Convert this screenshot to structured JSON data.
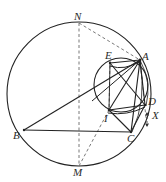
{
  "figure": {
    "stroke_color": "#222222",
    "dashed_color": "#666666",
    "background": "#ffffff",
    "width": 166,
    "height": 182
  },
  "circles": {
    "circumcircle": {
      "name": "large-circle",
      "cx": 79,
      "cy": 94,
      "r": 72
    },
    "inner_circle": {
      "name": "small-circle",
      "cx": 121,
      "cy": 85,
      "r": 27
    }
  },
  "points": {
    "A": {
      "label": "A",
      "x": 140,
      "y": 60,
      "label_x": 142,
      "label_y": 52
    },
    "B": {
      "label": "B",
      "x": 24,
      "y": 130,
      "label_x": 14,
      "label_y": 131
    },
    "C": {
      "label": "C",
      "x": 131,
      "y": 132,
      "label_x": 128,
      "label_y": 134
    },
    "D": {
      "label": "D",
      "x": 145,
      "y": 105,
      "label_x": 148,
      "label_y": 98
    },
    "E": {
      "label": "E",
      "x": 110,
      "y": 63,
      "label_x": 106,
      "label_y": 51
    },
    "I": {
      "label": "I",
      "x": 109,
      "y": 110,
      "label_x": 106,
      "label_y": 113
    },
    "M": {
      "label": "M",
      "x": 79,
      "y": 166,
      "label_x": 74,
      "label_y": 168
    },
    "N": {
      "label": "N",
      "x": 79,
      "y": 23,
      "label_x": 75,
      "label_y": 13
    },
    "X": {
      "label": "X",
      "x": 149,
      "y": 117,
      "label_x": 152,
      "label_y": 111
    }
  },
  "segments": [
    {
      "name": "segment-BC",
      "from": "B",
      "to": "C",
      "style": "solid"
    },
    {
      "name": "segment-BA",
      "from": "B",
      "to": "A",
      "style": "solid"
    },
    {
      "name": "segment-AC",
      "from": "A",
      "to": "C",
      "style": "solid"
    },
    {
      "name": "segment-AD",
      "from": "A",
      "to": "D",
      "style": "solid"
    },
    {
      "name": "segment-AI",
      "from": "A",
      "to": "I",
      "style": "solid"
    },
    {
      "name": "segment-EA",
      "from": "E",
      "to": "A",
      "style": "solid"
    },
    {
      "name": "segment-EI",
      "from": "E",
      "to": "I",
      "style": "solid"
    },
    {
      "name": "segment-ED",
      "from": "E",
      "to": "D",
      "style": "solid"
    },
    {
      "name": "segment-ID",
      "from": "I",
      "to": "D",
      "style": "solid"
    },
    {
      "name": "segment-IC",
      "from": "I",
      "to": "C",
      "style": "solid"
    },
    {
      "name": "segment-DC",
      "from": "D",
      "to": "C",
      "style": "solid"
    },
    {
      "name": "segment-NM",
      "from": "N",
      "to": "M",
      "style": "dashed"
    },
    {
      "name": "segment-NA",
      "from": "N",
      "to": "A",
      "style": "dashed"
    },
    {
      "name": "segment-MI",
      "from": "M",
      "to": "I",
      "style": "dashed"
    },
    {
      "name": "segment-ND-chord",
      "from": "N",
      "to": "D",
      "style": "dashed"
    },
    {
      "name": "segment-EM-vertical",
      "from": "E",
      "to": "M",
      "style": "dashed"
    }
  ],
  "markers": {
    "x_tick": {
      "name": "x-tick-marker",
      "x": 147,
      "y": 113,
      "length": 13
    }
  }
}
